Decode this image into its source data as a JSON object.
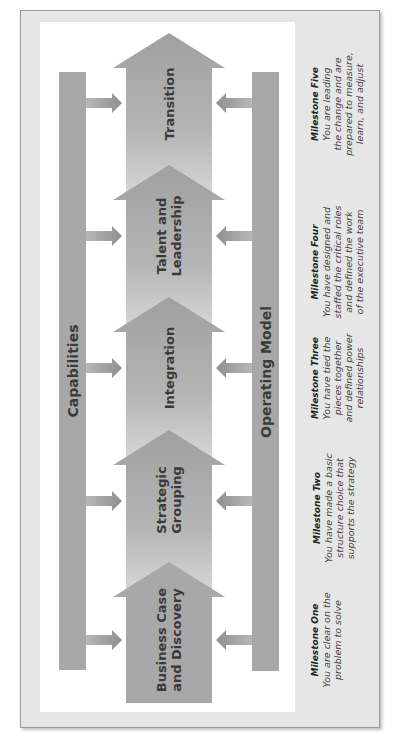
{
  "diagram": {
    "orientation": "rotated-90-ccw",
    "colors": {
      "frame_bg": "#e6e6e6",
      "panel_bg": "#ffffff",
      "bar": "#a8a8a8",
      "arrow_dark": "#a3a3a3",
      "arrow_light": "#dcdcdc",
      "text": "#3a3a3a"
    },
    "sidebars": {
      "left": {
        "label": "Capabilities"
      },
      "right": {
        "label": "Operating Model"
      }
    },
    "stages": [
      {
        "label_line1": "Business Case",
        "label_line2": "and Discovery"
      },
      {
        "label_line1": "Strategic",
        "label_line2": "Grouping"
      },
      {
        "label_line1": "Integration",
        "label_line2": ""
      },
      {
        "label_line1": "Talent and",
        "label_line2": "Leadership"
      },
      {
        "label_line1": "Transition",
        "label_line2": ""
      }
    ],
    "milestones": [
      {
        "title": "Milestone One",
        "lines": [
          "You are clear on the",
          "problem to solve"
        ]
      },
      {
        "title": "Milestone Two",
        "lines": [
          "You have made a basic",
          "structure choice that",
          "supports the strategy"
        ]
      },
      {
        "title": "Milestone Three",
        "lines": [
          "You have tied the",
          "pieces together",
          "and defined power",
          "relationships"
        ]
      },
      {
        "title": "Milestone Four",
        "lines": [
          "You have designed and",
          "staffed the critical roles",
          "and defined the work",
          "of the executive team"
        ]
      },
      {
        "title": "Milestone Five",
        "lines": [
          "You are leading",
          "the change and are",
          "prepared to measure,",
          "learn, and adjust"
        ]
      }
    ]
  }
}
